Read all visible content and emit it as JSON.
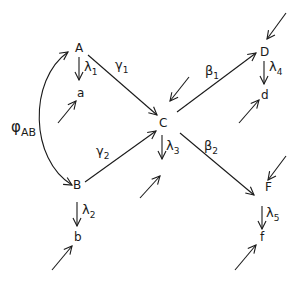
{
  "nodes": {
    "A": "A",
    "a": "a",
    "B": "B",
    "b": "b",
    "C": "C",
    "D": "D",
    "d": "d",
    "F": "F",
    "f": "f"
  },
  "edge_labels": {
    "gamma1": {
      "sym": "γ",
      "sub": "1"
    },
    "gamma2": {
      "sym": "γ",
      "sub": "2"
    },
    "beta1": {
      "sym": "β",
      "sub": "1"
    },
    "beta2": {
      "sym": "β",
      "sub": "2"
    },
    "lambda1": {
      "sym": "λ",
      "sub": "1"
    },
    "lambda2": {
      "sym": "λ",
      "sub": "2"
    },
    "lambda3": {
      "sym": "λ",
      "sub": "3"
    },
    "lambda4": {
      "sym": "λ",
      "sub": "4"
    },
    "lambda5": {
      "sym": "λ",
      "sub": "5"
    },
    "phiAB": {
      "sym": "φ",
      "sub": "AB"
    }
  },
  "edges": [
    {
      "from": "A",
      "to": "C",
      "label": "γ1"
    },
    {
      "from": "B",
      "to": "C",
      "label": "γ2"
    },
    {
      "from": "C",
      "to": "D",
      "label": "β1"
    },
    {
      "from": "C",
      "to": "F",
      "label": "β2"
    },
    {
      "from": "A",
      "to": "a",
      "label": "λ1"
    },
    {
      "from": "B",
      "to": "b",
      "label": "λ2"
    },
    {
      "from": "C",
      "to": "",
      "label": "λ3"
    },
    {
      "from": "D",
      "to": "d",
      "label": "λ4"
    },
    {
      "from": "F",
      "to": "f",
      "label": "λ5"
    },
    {
      "from": "B",
      "to": "A",
      "label": "φAB",
      "bidirectional": true
    }
  ]
}
